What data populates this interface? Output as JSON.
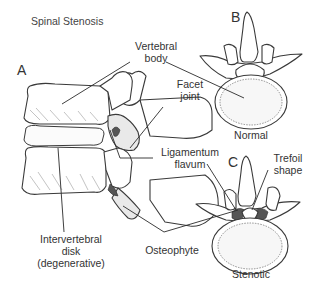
{
  "title": "Spinal Stenosis",
  "panels": {
    "A": "A",
    "B": "B",
    "C": "C"
  },
  "labels": {
    "vertebral_body_line1": "Vertebral",
    "vertebral_body_line2": "body",
    "facet_joint_line1": "Facet",
    "facet_joint_line2": "joint",
    "ligamentum_flavum_line1": "Ligamentum",
    "ligamentum_flavum_line2": "flavum",
    "trefoil_shape_line1": "Trefoil",
    "trefoil_shape_line2": "shape",
    "intervertebral_disk_line1": "Intervertebral",
    "intervertebral_disk_line2": "disk",
    "intervertebral_disk_line3": "(degenerative)",
    "osteophyte": "Osteophyte",
    "normal": "Normal",
    "stenotic": "Stenotic"
  },
  "colors": {
    "line": "#2a2a2a",
    "text": "#333333",
    "background": "#ffffff"
  }
}
